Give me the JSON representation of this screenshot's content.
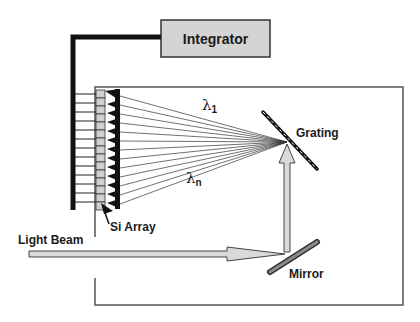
{
  "diagram": {
    "type": "spectrometer-schematic",
    "labels": {
      "integrator": "Integrator",
      "grating": "Grating",
      "mirror": "Mirror",
      "si_array": "Si Array",
      "light_beam": "Light Beam",
      "lambda_1": "λ",
      "lambda_1_sub": "1",
      "lambda_n": "λ",
      "lambda_n_sub": "n"
    },
    "colors": {
      "line": "#1a1a1a",
      "box_fill": "#d4d4d4",
      "beam_fill": "#d9d9d9",
      "frame": "#555555",
      "pixel_fill": "#d0d0d0"
    },
    "detector_pixels": 12,
    "dispersed_rays": 12
  }
}
